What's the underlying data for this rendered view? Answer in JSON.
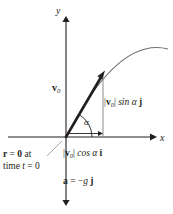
{
  "figure": {
    "type": "projectile-motion-vector-diagram",
    "background_color": "#ffffff",
    "ink_color": "#231f20",
    "curve_color": "#6d6e71",
    "thin_line_color": "#939598"
  },
  "axes": {
    "y_label": "y",
    "x_label": "x",
    "origin_px": [
      66,
      137
    ],
    "x_axis_from_px": [
      8,
      137
    ],
    "x_axis_to_px": [
      154,
      137
    ],
    "y_axis_from_px": [
      66,
      200
    ],
    "y_axis_to_px": [
      66,
      18
    ]
  },
  "vectors": {
    "initial_velocity": {
      "label_vec": "v",
      "label_sub": "0",
      "from_px": [
        66,
        137
      ],
      "to_px": [
        103,
        73
      ],
      "style": "bold-arrow"
    },
    "vertical_component": {
      "magnitude_open": "|",
      "label_vec": "v",
      "label_sub": "0",
      "magnitude_close": "|",
      "trig": " sin ",
      "angle": "α",
      "unit": " j",
      "from_px": [
        103,
        137
      ],
      "to_px": [
        103,
        73
      ]
    },
    "horizontal_component": {
      "magnitude_open": "|",
      "label_vec": "v",
      "label_sub": "0",
      "magnitude_close": "|",
      "trig": " cos ",
      "angle": "α",
      "unit": " i",
      "from_px": [
        66,
        134
      ],
      "to_px": [
        103,
        134
      ]
    }
  },
  "angle": {
    "label": "α",
    "arc_radius_px": 26,
    "from_degrees": 0,
    "to_degrees": 60
  },
  "annotations": {
    "initial_position": {
      "line1_vec": "r",
      "line1_eq": " = ",
      "line1_zero": "0",
      "line1_tail": " at",
      "line2_pre": "time ",
      "line2_var": "t",
      "line2_post": " = 0"
    },
    "acceleration": {
      "vec": "a",
      "eq": " = −",
      "g": "g",
      "unit": " j"
    }
  },
  "trajectory": {
    "description": "parabolic projectile path from origin rising to the right and flattening",
    "start_px": [
      66,
      137
    ],
    "control_px": [
      118,
      36
    ],
    "end_px": [
      168,
      49
    ]
  }
}
